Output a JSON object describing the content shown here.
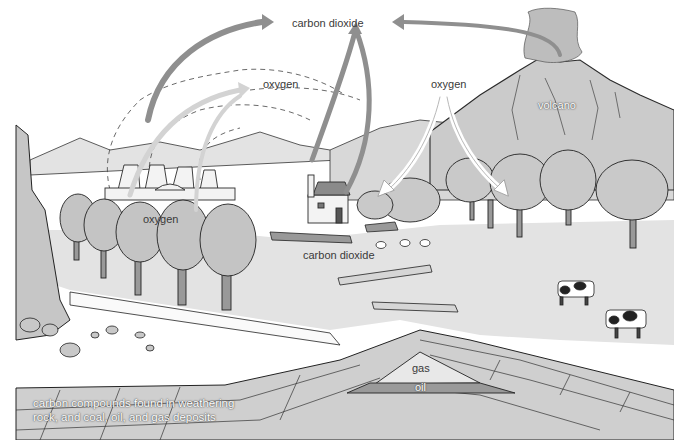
{
  "diagram": {
    "style": "grayscale pen-and-ink landscape",
    "labels": {
      "co2_top": "carbon dioxide",
      "oxygen_center": "oxygen",
      "oxygen_right": "oxygen",
      "volcano": "volcano",
      "oxygen_left_trees": "oxygen",
      "co2_ground": "carbon dioxide",
      "gas": "gas",
      "oil": "oil",
      "deposits_line1": "carbon compounds found in weathering",
      "deposits_line2": "rock, and coal, oil, and gas deposits"
    },
    "arrows": [
      {
        "from": "power station",
        "to": "carbon dioxide",
        "shade": "medium gray"
      },
      {
        "from": "power station",
        "to": "oxygen (center)",
        "shade": "light gray"
      },
      {
        "from": "trees (left)",
        "to": "oxygen (center)",
        "shade": "light gray"
      },
      {
        "from": "house chimney",
        "to": "carbon dioxide",
        "shade": "medium gray"
      },
      {
        "from": "carbon dioxide",
        "to": "house / ground",
        "shade": "medium gray"
      },
      {
        "from": "volcano",
        "to": "carbon dioxide",
        "shade": "medium gray"
      },
      {
        "from": "oxygen (right)",
        "to": "trees (middle)",
        "shade": "white outline"
      },
      {
        "from": "oxygen (right)",
        "to": "trees (right)",
        "shade": "white outline"
      }
    ],
    "elements": [
      "power station cooling towers",
      "house with chimney",
      "trees",
      "volcano",
      "cows",
      "logs",
      "sheep",
      "rock strata",
      "gas pocket",
      "oil layer",
      "rocky cliff"
    ],
    "colors": {
      "sky": "#ffffff",
      "hills": "#d6d6d6",
      "field": "#e2e2e2",
      "trees": "#c4c4c4",
      "strata": "#cfcfcf",
      "oil": "#9a9a9a",
      "arrow_dark": "#8f8f8f",
      "arrow_light": "#d0d0d0",
      "outline": "#2a2a2a"
    }
  }
}
